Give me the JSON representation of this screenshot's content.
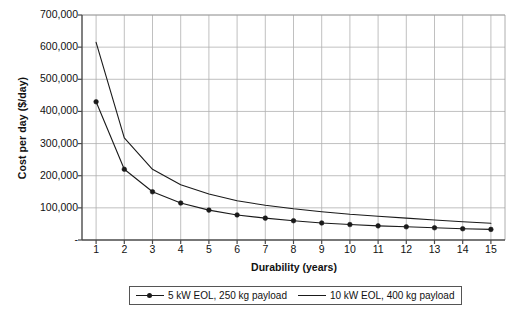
{
  "chart_data": {
    "type": "line",
    "title": "",
    "xlabel": "Durability (years)",
    "ylabel": "Cost per day ($/day)",
    "x": [
      1,
      2,
      3,
      4,
      5,
      6,
      7,
      8,
      9,
      10,
      11,
      12,
      13,
      14,
      15
    ],
    "xtick_labels": [
      "1",
      "2",
      "3",
      "4",
      "5",
      "6",
      "7",
      "8",
      "9",
      "10",
      "11",
      "12",
      "13",
      "14",
      "15"
    ],
    "xlim": [
      0.5,
      15.5
    ],
    "ylim": [
      0,
      700000
    ],
    "ytick_labels": [
      "700,000",
      "600,000",
      "500,000",
      "400,000",
      "300,000",
      "200,000",
      "100,000",
      "-"
    ],
    "ytick_values": [
      700000,
      600000,
      500000,
      400000,
      300000,
      200000,
      100000,
      0
    ],
    "grid": true,
    "grid_color": "#b0b0b0",
    "legend_position": "bottom",
    "series": [
      {
        "name": "5 kW  EOL, 250 kg payload",
        "marker": "circle",
        "color": "#1a1a1a",
        "values": [
          430000,
          220000,
          150000,
          115000,
          93000,
          78000,
          68000,
          60000,
          53000,
          48000,
          44000,
          41000,
          38000,
          35000,
          33000
        ]
      },
      {
        "name": "10 kW  EOL, 400 kg payload",
        "marker": "none",
        "color": "#1a1a1a",
        "values": [
          615000,
          318000,
          220000,
          172000,
          143000,
          122000,
          108000,
          97000,
          88000,
          80000,
          74000,
          68000,
          62000,
          57000,
          52000
        ]
      }
    ]
  },
  "legend": {
    "entries": [
      {
        "label": "5 kW  EOL, 250 kg payload"
      },
      {
        "label": "10 kW  EOL, 400 kg payload"
      }
    ]
  }
}
